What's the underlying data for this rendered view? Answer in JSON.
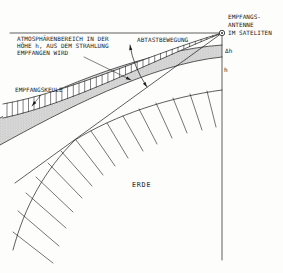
{
  "diagram": {
    "atmosphere_label": {
      "line1": "ATMOSPHÄRENBEREICH IN DER",
      "line2": "HÖHE h, AUS DEM STRAHLUNG",
      "line3": "EMPFANGEN WIRD"
    },
    "scan_label": "ABTASTBEWEGUNG",
    "beam_label": "EMPFANGSKEULE",
    "satellite_label": {
      "line1": "EMPFANGS-",
      "line2": "ANTENNE",
      "line3": "IM SATELITEN"
    },
    "delta_h_label": "Δh",
    "h_label": "h",
    "earth_label": "ERDE",
    "colors": {
      "ink": "#1a1a1a",
      "band_fill": "#dcdcdc",
      "band_dots": "#8f8f8f",
      "background": "#fdfdfc"
    }
  }
}
